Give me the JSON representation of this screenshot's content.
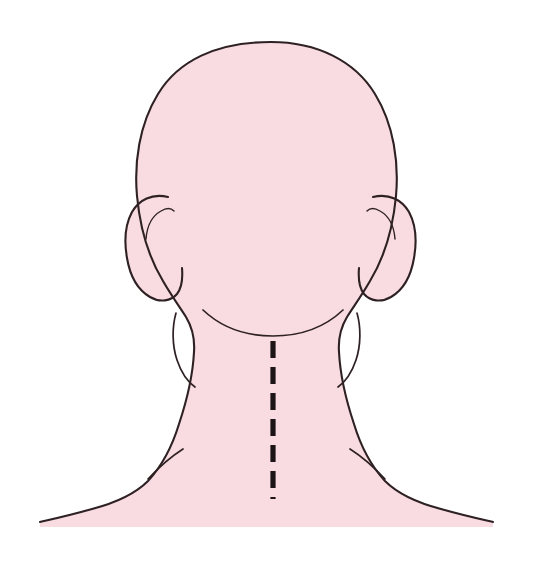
{
  "figure": {
    "kind": "anatomical-illustration",
    "orientation": "posterior",
    "canvas": {
      "width": 533,
      "height": 575,
      "background_color": "#ffffff"
    },
    "palette": {
      "skin_fill": "#f9dce2",
      "outline_stroke": "#2e2124",
      "midline_stroke": "#1c1416",
      "background": "#ffffff"
    },
    "caption": "",
    "labels": []
  },
  "regions": {
    "cranium": {
      "name": "cranium",
      "top_y": 42,
      "left_x": 143,
      "right_x": 398,
      "center_x": 271
    },
    "ear_left": {
      "name": "left ear",
      "top_y": 195,
      "bottom_y": 300,
      "outer_x": 126
    },
    "ear_right": {
      "name": "right ear",
      "top_y": 195,
      "bottom_y": 300,
      "outer_x": 414
    },
    "hairline": {
      "name": "posterior hairline",
      "start_x": 203,
      "end_x": 343,
      "lowest_y": 330
    },
    "neck": {
      "name": "neck",
      "left_x": 178,
      "right_x": 360
    },
    "shoulder_left": {
      "name": "left shoulder",
      "end_x": 40,
      "end_y": 522
    },
    "shoulder_right": {
      "name": "right shoulder",
      "end_x": 493,
      "end_y": 522
    }
  },
  "midline": {
    "name": "cervical spine midline incision marker",
    "style": "dashed",
    "x": 273,
    "start_y": 341,
    "end_y": 499,
    "dash_count": 7,
    "dash_length": 17,
    "gap_length": 9,
    "stroke_width": 5.2,
    "color": "#1c1416"
  }
}
